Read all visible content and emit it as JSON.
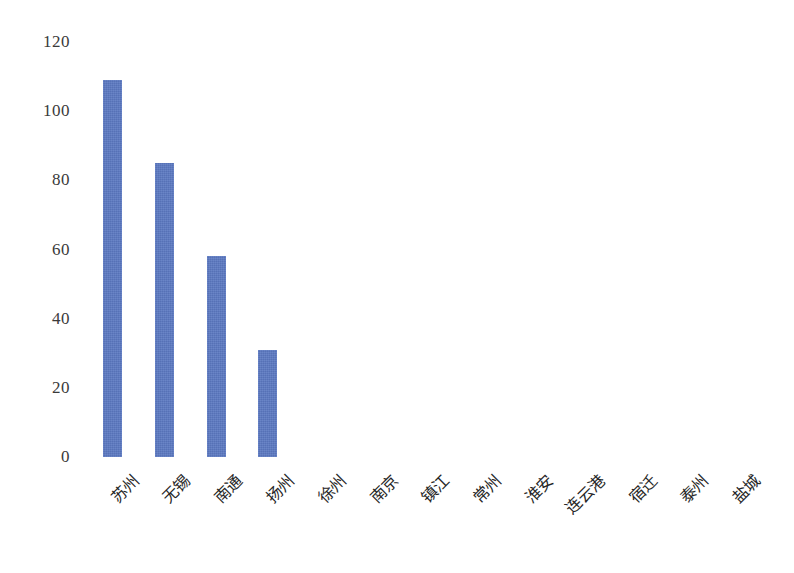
{
  "chart_data": {
    "type": "bar",
    "title": "",
    "subtitle": "",
    "xlabel": "",
    "ylabel": "",
    "categories": [
      "苏州",
      "无锡",
      "南通",
      "扬州",
      "徐州",
      "南京",
      "镇江",
      "常州",
      "淮安",
      "连云港",
      "宿迁",
      "泰州",
      "盐城"
    ],
    "values": [
      109,
      85,
      58,
      31,
      0,
      0,
      0,
      0,
      0,
      0,
      0,
      0,
      0
    ],
    "ylim": [
      0,
      120
    ],
    "yticks": [
      0,
      20,
      40,
      60,
      80,
      100,
      120
    ],
    "ytick_labels": [
      "0",
      "20",
      "40",
      "60",
      "80",
      "100",
      "120"
    ],
    "grid": false,
    "legend": null,
    "legend_position": "none",
    "series": [
      {
        "name": "",
        "color": "#5c79c2",
        "values": [
          109,
          85,
          58,
          31,
          0,
          0,
          0,
          0,
          0,
          0,
          0,
          0,
          0
        ]
      }
    ],
    "annotations": []
  },
  "style": {
    "bar_color": "#5c79c2",
    "background": "#ffffff",
    "tick_label_color": "#3a3a3a",
    "category_label_color": "#262626"
  }
}
